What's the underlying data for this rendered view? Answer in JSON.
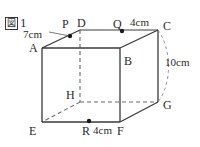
{
  "figure": {
    "label_box_text": "図",
    "label_number": "1",
    "caption": "図1"
  },
  "solid": {
    "type": "rectangular-prism",
    "vertices": [
      {
        "name": "A",
        "label": "A",
        "x": 42,
        "y": 48,
        "label_x": 29,
        "label_y": 42
      },
      {
        "name": "B",
        "label": "B",
        "x": 120,
        "y": 48,
        "label_x": 124,
        "label_y": 55
      },
      {
        "name": "C",
        "label": "C",
        "x": 158,
        "y": 30,
        "label_x": 163,
        "label_y": 20
      },
      {
        "name": "D",
        "label": "D",
        "x": 80,
        "y": 30,
        "label_x": 77,
        "label_y": 17
      },
      {
        "name": "E",
        "label": "E",
        "x": 42,
        "y": 122,
        "label_x": 29,
        "label_y": 126
      },
      {
        "name": "F",
        "label": "F",
        "x": 120,
        "y": 122,
        "label_x": 117,
        "label_y": 126
      },
      {
        "name": "G",
        "label": "G",
        "x": 158,
        "y": 102,
        "label_x": 163,
        "label_y": 100
      },
      {
        "name": "H",
        "label": "H",
        "x": 80,
        "y": 102,
        "label_x": 66,
        "label_y": 90
      }
    ]
  },
  "points": [
    {
      "name": "P",
      "label": "P",
      "on_edge": "AD",
      "x": 70,
      "y": 36,
      "label_x": 62,
      "label_y": 18
    },
    {
      "name": "Q",
      "label": "Q",
      "on_edge": "DC",
      "x": 122,
      "y": 31,
      "label_x": 113,
      "label_y": 18
    },
    {
      "name": "R",
      "label": "R",
      "on_edge": "EF",
      "x": 89,
      "y": 121,
      "label_x": 82,
      "label_y": 126
    }
  ],
  "dimensions": [
    {
      "name": "AP",
      "text": "7cm",
      "x": 26,
      "y": 29
    },
    {
      "name": "QC",
      "text": "4cm",
      "x": 130,
      "y": 17
    },
    {
      "name": "CG",
      "text": "10cm",
      "x": 165,
      "y": 58
    },
    {
      "name": "RF",
      "text": "4cm",
      "x": 93,
      "y": 126
    }
  ],
  "colors": {
    "stroke": "#3a3a3a",
    "dashed": "#6a6a6a",
    "text": "#2b2b2b",
    "background": "#ffffff",
    "point_fill": "#1a1a1a"
  }
}
